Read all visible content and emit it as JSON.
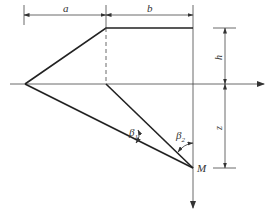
{
  "diagram": {
    "labels": {
      "a": "a",
      "b": "b",
      "h": "h",
      "z": "z",
      "beta1": "β",
      "beta1_sub": "1",
      "beta2": "β",
      "beta2_sub": "2",
      "M": "M"
    },
    "colors": {
      "line": "#222222",
      "thin": "#444444",
      "background": "#ffffff"
    }
  }
}
